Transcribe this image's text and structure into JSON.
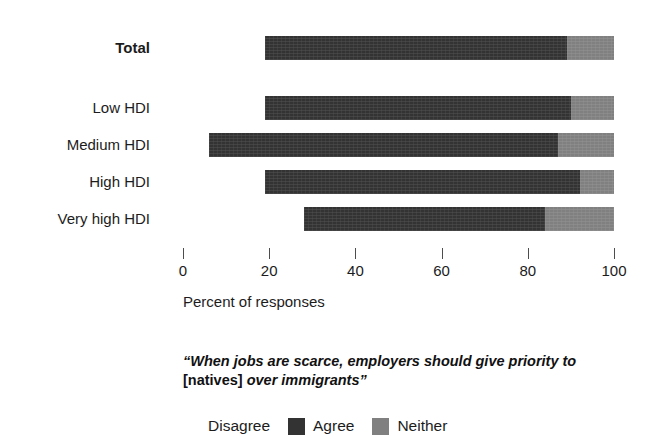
{
  "chart_data": {
    "type": "bar",
    "orientation": "horizontal",
    "stacked": true,
    "title": "",
    "xlabel": "Percent of responses",
    "ylabel": "",
    "xlim": [
      0,
      100
    ],
    "grid": false,
    "legend_position": "bottom",
    "categories": [
      "Total",
      "Low HDI",
      "Medium HDI",
      "High HDI",
      "Very high HDI"
    ],
    "series": [
      {
        "name": "Disagree",
        "color": "#ffffff",
        "values": [
          19,
          19,
          6,
          19,
          28
        ]
      },
      {
        "name": "Agree",
        "color": "#333333",
        "values": [
          70,
          71,
          81,
          73,
          56
        ]
      },
      {
        "name": "Neither",
        "color": "#808080",
        "values": [
          11,
          10,
          13,
          8,
          16
        ]
      }
    ],
    "x_ticks": [
      0,
      20,
      40,
      60,
      80,
      100
    ],
    "x_tick_labels": [
      "0",
      "20",
      "40",
      "60",
      "80",
      "100"
    ],
    "annotation": "“When jobs are scarce, employers should give priority to [natives] over immigrants”"
  },
  "axis": {
    "title": "Percent of responses",
    "ticks": [
      {
        "value": 0,
        "label": "0"
      },
      {
        "value": 20,
        "label": "20"
      },
      {
        "value": 40,
        "label": "40"
      },
      {
        "value": 60,
        "label": "60"
      },
      {
        "value": 80,
        "label": "80"
      },
      {
        "value": 100,
        "label": "100"
      }
    ]
  },
  "rows": [
    {
      "label": "Total",
      "bold": true,
      "disagree": 19,
      "agree": 70,
      "neither": 11
    },
    {
      "label": "Low HDI",
      "bold": false,
      "disagree": 19,
      "agree": 71,
      "neither": 10
    },
    {
      "label": "Medium HDI",
      "bold": false,
      "disagree": 6,
      "agree": 81,
      "neither": 13
    },
    {
      "label": "High HDI",
      "bold": false,
      "disagree": 19,
      "agree": 73,
      "neither": 8
    },
    {
      "label": "Very high HDI",
      "bold": false,
      "disagree": 28,
      "agree": 56,
      "neither": 16
    }
  ],
  "caption": {
    "part1": "“When jobs are scarce, employers should give priority to ",
    "part2": "[natives]",
    "part3": " over immigrants”"
  },
  "legend": {
    "items": [
      {
        "label": "Disagree",
        "color": "#ffffff",
        "swatch_class": "sw-disagree"
      },
      {
        "label": "Agree",
        "color": "#333333",
        "swatch_class": "sw-agree"
      },
      {
        "label": "Neither",
        "color": "#808080",
        "swatch_class": "sw-neither"
      }
    ]
  },
  "colors": {
    "disagree": "#ffffff",
    "agree": "#333333",
    "neither": "#808080",
    "text": "#1c1c1c",
    "background": "#ffffff"
  }
}
